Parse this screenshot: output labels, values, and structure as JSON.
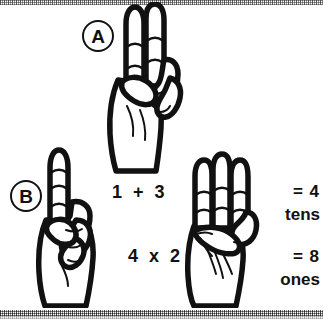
{
  "figure": {
    "background_color": "#ffffff",
    "ink_color": "#111111"
  },
  "labels": [
    {
      "id": "A",
      "text": "A"
    },
    {
      "id": "B",
      "text": "B"
    }
  ],
  "equations": {
    "top": "1  +  3",
    "bottom": "4  x  2"
  },
  "results": {
    "first": {
      "value": "= 4",
      "unit": "tens"
    },
    "second": {
      "value": "= 8",
      "unit": "ones"
    }
  },
  "hands": [
    {
      "id": "hand-a",
      "name": "hand-sign-two-over-six",
      "description": "Hand with index and middle fingers extended upward, ring and little fingers folded with thumb",
      "extended_fingers": 2
    },
    {
      "id": "hand-b",
      "name": "hand-sign-one",
      "description": "Hand with index finger extended upward, other fingers folded into fist",
      "extended_fingers": 1
    },
    {
      "id": "hand-c",
      "name": "hand-sign-three",
      "description": "Hand with index, middle and ring fingers extended upward",
      "extended_fingers": 3
    }
  ],
  "decorations": {
    "scan_band_top": "dithered halftone band",
    "scan_band_bottom": "dithered halftone band"
  }
}
